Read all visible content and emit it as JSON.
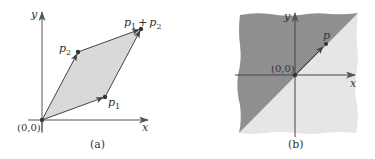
{
  "colors": {
    "axis": "#555555",
    "vector": "#444444",
    "parallelogram_fill": "#d9d9d9",
    "dark_region": "#8f8f8f",
    "light_region": "#e6e6e6",
    "text": "#333333"
  },
  "panel_a": {
    "caption": "(a)",
    "x_axis_label": "x",
    "y_axis_label": "y",
    "origin_label": "(0,0)",
    "points": {
      "p1": {
        "label_base": "p",
        "label_sub": "1"
      },
      "p2": {
        "label_base": "p",
        "label_sub": "2"
      },
      "sum": {
        "label_a_base": "p",
        "label_a_sub": "1",
        "plus": "+",
        "label_b_base": "p",
        "label_b_sub": "2"
      }
    }
  },
  "panel_b": {
    "caption": "(b)",
    "x_axis_label": "x",
    "y_axis_label": "y",
    "origin_label": "(0,0)",
    "point_label": "p"
  }
}
